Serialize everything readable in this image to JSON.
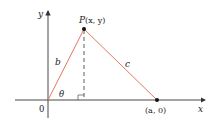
{
  "diagram": {
    "axes": {
      "x_label": "x",
      "y_label": "y",
      "origin_label": "0"
    },
    "points": {
      "P": {
        "label_name": "P",
        "label_coords": "(x, y)"
      },
      "A": {
        "label": "(a, 0)"
      }
    },
    "sides": {
      "b": "b",
      "c": "c"
    },
    "angle": {
      "label": "θ"
    },
    "colors": {
      "triangle": "#e07a5f",
      "axes": "#333333",
      "dashed": "#333333"
    }
  }
}
